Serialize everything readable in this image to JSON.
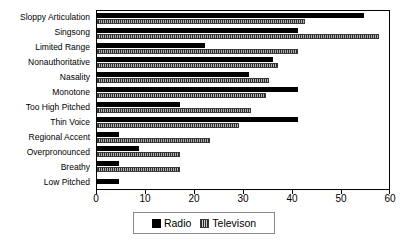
{
  "chart_data": {
    "type": "bar",
    "orientation": "horizontal",
    "title": "",
    "xlabel": "",
    "ylabel": "",
    "xlim": [
      0,
      60
    ],
    "xticks": [
      0,
      10,
      20,
      30,
      40,
      50,
      60
    ],
    "grid": false,
    "legend_position": "bottom",
    "categories": [
      "Sloppy Articulation",
      "Singsong",
      "Limited Range",
      "Nonauthoritative",
      "Nasality",
      "Monotone",
      "Too High Pitched",
      "Thin Voice",
      "Regional Accent",
      "Overpronounced",
      "Breathy",
      "Low Pitched"
    ],
    "series": [
      {
        "name": "Radio",
        "color": "#000000",
        "values": [
          54.5,
          41,
          22,
          36,
          31,
          41,
          17,
          41,
          4.5,
          8.5,
          4.5,
          4.5
        ]
      },
      {
        "name": "Televison",
        "color": "#808080",
        "values": [
          42.5,
          57.5,
          41,
          37,
          35,
          34.5,
          31.5,
          29,
          23,
          17,
          17,
          0
        ]
      }
    ]
  },
  "legend": {
    "entries": [
      {
        "label": "Radio",
        "swatch": "radio-swatch"
      },
      {
        "label": "Televison",
        "swatch": "television-swatch"
      }
    ]
  }
}
